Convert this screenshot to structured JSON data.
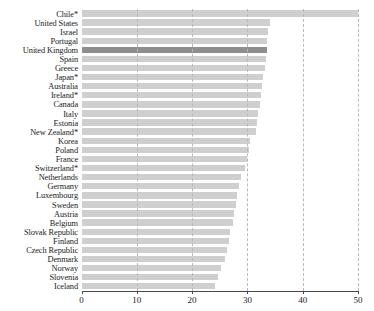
{
  "chart_data": {
    "type": "bar",
    "orientation": "horizontal",
    "title": "",
    "subtitle": "",
    "xlabel": "",
    "ylabel": "",
    "xlim": [
      0,
      50
    ],
    "xticks": [
      0,
      10,
      20,
      30,
      40,
      50
    ],
    "xtick_labels": [
      "0",
      "10",
      "20",
      "30",
      "40",
      "50"
    ],
    "grid": "vertical-dashed",
    "legend": "none",
    "highlight_category": "United Kingdom",
    "colors": {
      "bar": "#cfcfcf",
      "bar_highlight": "#8e8e8e",
      "gridline": "#b9b9b9",
      "axis": "#4a4a4a",
      "text": "#1b1b1b",
      "background": "#ffffff"
    },
    "categories": [
      "Chile*",
      "United States",
      "Israel",
      "Portugal",
      "United Kingdom",
      "Spain",
      "Greece",
      "Japan*",
      "Australia",
      "Ireland*",
      "Canada",
      "Italy",
      "Estonia",
      "New Zealand*",
      "Korea",
      "Poland",
      "France",
      "Switzerland*",
      "Netherlands",
      "Germany",
      "Luxembourg",
      "Sweden",
      "Austria",
      "Belgium",
      "Slovak Republic",
      "Finland",
      "Czech Republic",
      "Denmark",
      "Norway",
      "Slovenia",
      "Iceland"
    ],
    "values": [
      50.0,
      34.0,
      33.8,
      33.6,
      33.5,
      33.3,
      33.1,
      32.9,
      32.6,
      32.4,
      32.2,
      32.0,
      31.8,
      31.5,
      30.4,
      30.2,
      29.9,
      29.6,
      28.8,
      28.4,
      28.1,
      27.9,
      27.6,
      27.4,
      26.8,
      26.6,
      26.4,
      25.9,
      25.3,
      24.7,
      24.2
    ]
  }
}
